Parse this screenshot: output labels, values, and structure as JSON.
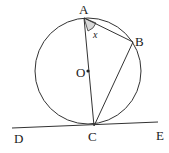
{
  "diagram": {
    "type": "geometry-circle-tangent",
    "labels": {
      "A": "A",
      "B": "B",
      "C": "C",
      "O": "O",
      "D": "D",
      "E": "E",
      "angle": "x"
    },
    "colors": {
      "stroke": "#333333",
      "angle_fill": "#d9d9d9"
    }
  }
}
